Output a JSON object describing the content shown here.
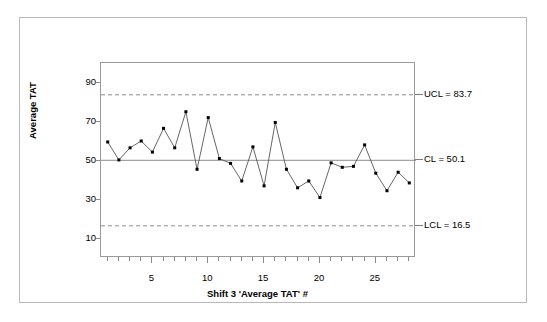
{
  "chart_data": {
    "type": "line",
    "title": "",
    "xlabel": "Shift 3 'Average TAT' #",
    "ylabel": "Average TAT",
    "x": [
      1,
      2,
      3,
      4,
      5,
      6,
      7,
      8,
      9,
      10,
      11,
      12,
      13,
      14,
      15,
      16,
      17,
      18,
      19,
      20,
      21,
      22,
      23,
      24,
      25,
      26,
      27,
      28
    ],
    "values": [
      59.5,
      50.3,
      56.5,
      60.0,
      54.3,
      66.5,
      56.5,
      75.0,
      45.5,
      72.0,
      51.0,
      48.5,
      39.5,
      57.0,
      37.0,
      69.5,
      45.5,
      36.0,
      39.5,
      31.0,
      48.8,
      46.5,
      47.0,
      58.0,
      43.5,
      34.5,
      44.0,
      38.5
    ],
    "series": [
      {
        "name": "Average TAT",
        "values": [
          59.5,
          50.3,
          56.5,
          60.0,
          54.3,
          66.5,
          56.5,
          75.0,
          45.5,
          72.0,
          51.0,
          48.5,
          39.5,
          57.0,
          37.0,
          69.5,
          45.5,
          36.0,
          39.5,
          31.0,
          48.8,
          46.5,
          47.0,
          58.0,
          43.5,
          34.5,
          44.0,
          38.5
        ]
      }
    ],
    "xlim": [
      0.4,
      28.6
    ],
    "ylim": [
      0,
      100
    ],
    "ytick_labels": [
      "10",
      "30",
      "50",
      "70",
      "90"
    ],
    "ytick_values": [
      10,
      30,
      50,
      70,
      90
    ],
    "xtick_labels": [
      "5",
      "10",
      "15",
      "20",
      "25"
    ],
    "xtick_values": [
      5,
      10,
      15,
      20,
      25
    ],
    "grid": false,
    "legend_position": "none",
    "control_limits": {
      "ucl": {
        "value": 83.7,
        "label": "UCL = 83.7",
        "style": "dashed"
      },
      "cl": {
        "value": 50.1,
        "label": "CL = 50.1",
        "style": "solid"
      },
      "lcl": {
        "value": 16.5,
        "label": "LCL = 16.5",
        "style": "dashed"
      }
    },
    "marker": "filled-square",
    "line_color": "#555555",
    "marker_color": "#000000",
    "limit_color": "#808080"
  }
}
